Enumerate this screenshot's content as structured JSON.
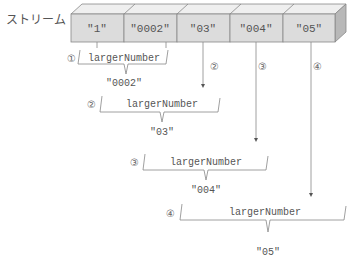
{
  "diagram": {
    "stream_label": "ストリーム",
    "stream_elements": [
      "\"1\"",
      "\"0002\"",
      "\"03\"",
      "\"004\"",
      "\"05\""
    ],
    "function_name": "largerNumber",
    "steps": [
      {
        "marker": "①",
        "function": "largerNumber",
        "result": "\"0002\""
      },
      {
        "marker": "②",
        "function": "largerNumber",
        "result": "\"03\""
      },
      {
        "marker": "③",
        "function": "largerNumber",
        "result": "\"004\""
      },
      {
        "marker": "④",
        "function": "largerNumber",
        "result": "\"05\""
      }
    ],
    "arrow_markers": [
      "②",
      "③",
      "④"
    ],
    "colors": {
      "cell_fill": "#dcdcdc",
      "cell_top": "#efefef",
      "cell_side": "#b8b8b8",
      "stroke": "#888888",
      "text": "#555555"
    }
  }
}
